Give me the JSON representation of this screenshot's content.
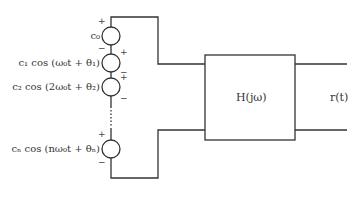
{
  "diagram": {
    "sources": [
      {
        "id": "c0",
        "label": "c₀",
        "cy": 36
      },
      {
        "id": "c1",
        "label": "c₁ cos (ω₀t + θ₁)",
        "cy": 63
      },
      {
        "id": "c2",
        "label": "c₂ cos (2ω₀t + θ₂)",
        "cy": 87
      },
      {
        "id": "cn",
        "label": "cₙ cos (nω₀t + θₙ)",
        "cy": 149
      }
    ],
    "signs": {
      "plus": "+",
      "minus": "−"
    },
    "block": {
      "label": "H(jω)"
    },
    "output": {
      "label": "r(t)"
    },
    "colors": {
      "line": "#333333",
      "text": "#333333"
    }
  }
}
